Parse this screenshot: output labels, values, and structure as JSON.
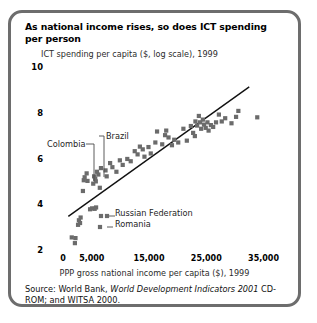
{
  "panel": {
    "title": "As national income rises, so does ICT spending per person",
    "border_color": "#6d6d6d",
    "background": "#ffffff"
  },
  "source": {
    "prefix": "Source: World Bank, ",
    "italic": "World Development Indicators 2001",
    "suffix": " CD-ROM; and WITSA 2000."
  },
  "chart_data": {
    "type": "scatter",
    "title": "As national income rises, so does ICT spending per person",
    "subtitle": "ICT spending per capita ($, log scale), 1999",
    "xlabel": "PPP gross national income per capita ($), 1999",
    "ylabel": "ICT spending per capita ($, log scale), 1999",
    "xlim": [
      -2300,
      37000
    ],
    "ylim": [
      2,
      10
    ],
    "xticks": [
      0,
      5000,
      15000,
      25000,
      35000
    ],
    "xticklabels": [
      "0",
      "5,000",
      "15,000",
      "25,000",
      "35,000"
    ],
    "yticks": [
      2,
      4,
      6,
      8,
      10
    ],
    "yticklabels": [
      "2",
      "4",
      "6",
      "8",
      "10"
    ],
    "grid": false,
    "legend": false,
    "marker": "square",
    "marker_color": "#6b6b6b",
    "marker_size": 4.2,
    "trendline": {
      "label": "fitted regression line",
      "color": "#111111",
      "width": 1.4,
      "x": [
        900,
        32500
      ],
      "y": [
        3.47,
        9.13
      ]
    },
    "points": [
      {
        "x": 1500,
        "y": 2.55
      },
      {
        "x": 2050,
        "y": 2.3
      },
      {
        "x": 2150,
        "y": 2.52
      },
      {
        "x": 2600,
        "y": 3.1
      },
      {
        "x": 2750,
        "y": 3.3
      },
      {
        "x": 2950,
        "y": 3.18
      },
      {
        "x": 3050,
        "y": 3.42
      },
      {
        "x": 4700,
        "y": 3.78
      },
      {
        "x": 5050,
        "y": 3.82
      },
      {
        "x": 5500,
        "y": 3.8
      },
      {
        "x": 5750,
        "y": 3.86
      },
      {
        "x": 3450,
        "y": 4.58
      },
      {
        "x": 3600,
        "y": 5.05
      },
      {
        "x": 3750,
        "y": 5.18
      },
      {
        "x": 4100,
        "y": 5.35
      },
      {
        "x": 4250,
        "y": 5.02
      },
      {
        "x": 5250,
        "y": 4.9
      },
      {
        "x": 5400,
        "y": 5.22
      },
      {
        "x": 5600,
        "y": 5.12
      },
      {
        "x": 5700,
        "y": 5.0
      },
      {
        "x": 5900,
        "y": 5.42
      },
      {
        "x": 6150,
        "y": 5.3
      },
      {
        "x": 6400,
        "y": 4.72
      },
      {
        "x": 6600,
        "y": 5.58
      },
      {
        "x": 7400,
        "y": 5.48
      },
      {
        "x": 7600,
        "y": 5.22
      },
      {
        "x": 8200,
        "y": 5.8
      },
      {
        "x": 8600,
        "y": 5.62
      },
      {
        "x": 9300,
        "y": 5.42
      },
      {
        "x": 9900,
        "y": 5.92
      },
      {
        "x": 10400,
        "y": 5.72
      },
      {
        "x": 11200,
        "y": 5.98
      },
      {
        "x": 11800,
        "y": 5.88
      },
      {
        "x": 12500,
        "y": 6.32
      },
      {
        "x": 13000,
        "y": 6.18
      },
      {
        "x": 13400,
        "y": 6.52
      },
      {
        "x": 13900,
        "y": 6.4
      },
      {
        "x": 14200,
        "y": 6.08
      },
      {
        "x": 14900,
        "y": 6.5
      },
      {
        "x": 15300,
        "y": 6.22
      },
      {
        "x": 16100,
        "y": 6.7
      },
      {
        "x": 16400,
        "y": 7.18
      },
      {
        "x": 17300,
        "y": 6.62
      },
      {
        "x": 17800,
        "y": 7.02
      },
      {
        "x": 18400,
        "y": 6.92
      },
      {
        "x": 19000,
        "y": 6.58
      },
      {
        "x": 19400,
        "y": 6.82
      },
      {
        "x": 21000,
        "y": 7.3
      },
      {
        "x": 21600,
        "y": 6.78
      },
      {
        "x": 22300,
        "y": 7.42
      },
      {
        "x": 22700,
        "y": 7.12
      },
      {
        "x": 23100,
        "y": 7.62
      },
      {
        "x": 23400,
        "y": 7.44
      },
      {
        "x": 23700,
        "y": 7.86
      },
      {
        "x": 23900,
        "y": 7.58
      },
      {
        "x": 24100,
        "y": 7.3
      },
      {
        "x": 24400,
        "y": 7.7
      },
      {
        "x": 24600,
        "y": 7.48
      },
      {
        "x": 24900,
        "y": 7.34
      },
      {
        "x": 25200,
        "y": 7.58
      },
      {
        "x": 25400,
        "y": 7.22
      },
      {
        "x": 25800,
        "y": 7.46
      },
      {
        "x": 26200,
        "y": 7.38
      },
      {
        "x": 26700,
        "y": 7.58
      },
      {
        "x": 27200,
        "y": 7.92
      },
      {
        "x": 27700,
        "y": 7.62
      },
      {
        "x": 28300,
        "y": 7.76
      },
      {
        "x": 29400,
        "y": 7.54
      },
      {
        "x": 30200,
        "y": 7.82
      },
      {
        "x": 30600,
        "y": 8.08
      },
      {
        "x": 33900,
        "y": 7.8
      },
      {
        "x": 23000,
        "y": 6.98
      },
      {
        "x": 20100,
        "y": 6.7
      },
      {
        "x": 18000,
        "y": 7.22
      }
    ],
    "annotations": [
      {
        "label": "Colombia",
        "text_x": 36,
        "text_y": 131,
        "point_x": 82,
        "point_y": 171
      },
      {
        "label": "Brazil",
        "text_x": 95,
        "text_y": 123,
        "point_x": 92,
        "point_y": 166
      },
      {
        "label": "Russian Federation",
        "text_x": 104,
        "text_y": 200,
        "point_x": 96,
        "point_y": 204
      },
      {
        "label": "Romania",
        "text_x": 104,
        "text_y": 211,
        "point_x": 89,
        "point_y": 215
      }
    ]
  }
}
